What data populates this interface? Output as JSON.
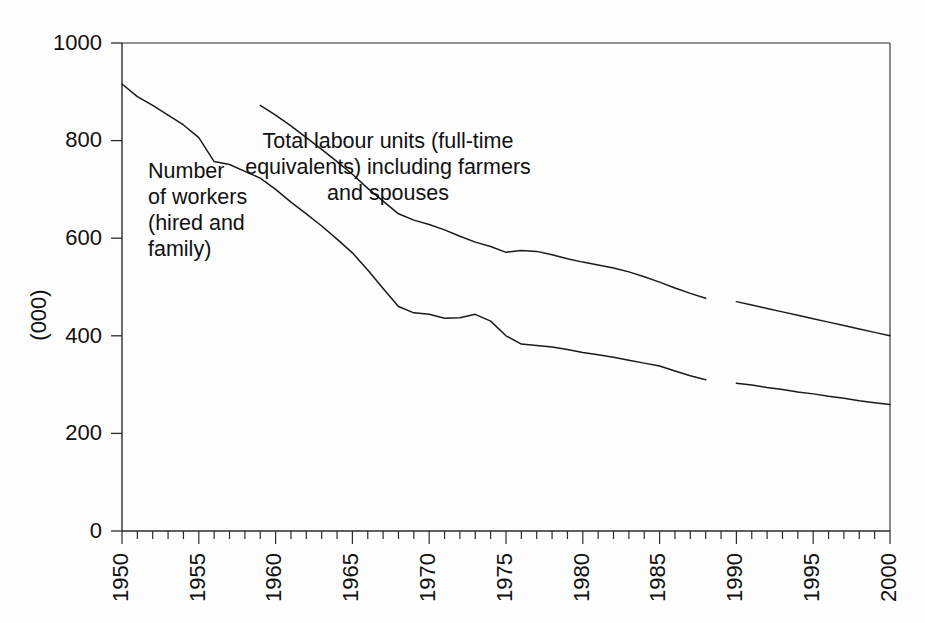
{
  "chart_data": {
    "type": "line",
    "title": "",
    "xlabel": "",
    "ylabel": "(000)",
    "xlim": [
      1950,
      2000
    ],
    "ylim": [
      0,
      1000
    ],
    "x_ticks_major": [
      "1950",
      "1955",
      "1960",
      "1965",
      "1970",
      "1975",
      "1980",
      "1985",
      "1990",
      "1995",
      "2000"
    ],
    "x_tick_interval_minor": 1,
    "y_ticks": [
      "0",
      "200",
      "400",
      "600",
      "800",
      "1000"
    ],
    "grid": false,
    "legend_position": "inline-annotations",
    "annotations": [
      {
        "name": "workers-annotation",
        "text_lines": [
          "Number",
          "of workers",
          "(hired and",
          "family)"
        ],
        "x_px": 148,
        "y_px": 178
      },
      {
        "name": "labour-units-annotation",
        "text_lines": [
          "Total labour units (full-time",
          "equivalents) including farmers",
          "and spouses"
        ],
        "x_px": 388,
        "y_px": 148
      }
    ],
    "series": [
      {
        "name": "Total labour units (full-time equivalents) including farmers and spouses",
        "color": "#1a1a1a",
        "x": [
          1959,
          1960,
          1961,
          1962,
          1963,
          1964,
          1965,
          1966,
          1967,
          1968,
          1969,
          1970,
          1971,
          1972,
          1973,
          1974,
          1975,
          1976,
          1977,
          1978,
          1979,
          1980,
          1981,
          1982,
          1983,
          1984,
          1985,
          1986,
          1987,
          1988
        ],
        "y": [
          872,
          852,
          830,
          806,
          782,
          757,
          731,
          702,
          676,
          650,
          637,
          628,
          617,
          604,
          592,
          583,
          571,
          575,
          573,
          566,
          558,
          551,
          545,
          539,
          531,
          521,
          510,
          498,
          487,
          477
        ],
        "x_projected": [
          1990,
          1991,
          1992,
          1993,
          1994,
          1995,
          1996,
          1997,
          1998,
          1999,
          2000
        ],
        "y_projected": [
          470,
          463,
          456,
          449,
          442,
          435,
          428,
          421,
          414,
          407,
          400
        ],
        "break_note": "gap between 1988 and 1990"
      },
      {
        "name": "Number of workers (hired and family)",
        "color": "#1a1a1a",
        "x": [
          1950,
          1951,
          1952,
          1953,
          1954,
          1955,
          1956,
          1957,
          1958,
          1959,
          1960,
          1961,
          1962,
          1963,
          1964,
          1965,
          1966,
          1967,
          1968,
          1969,
          1970,
          1971,
          1972,
          1973,
          1974,
          1975,
          1976,
          1977,
          1978,
          1979,
          1980,
          1981,
          1982,
          1983,
          1984,
          1985,
          1986,
          1987,
          1988
        ],
        "y": [
          916,
          890,
          872,
          852,
          832,
          806,
          757,
          751,
          737,
          723,
          700,
          674,
          650,
          625,
          598,
          570,
          535,
          497,
          460,
          447,
          444,
          436,
          437,
          444,
          430,
          400,
          383,
          380,
          377,
          372,
          366,
          361,
          356,
          350,
          344,
          338,
          328,
          318,
          310
        ],
        "x_projected": [
          1990,
          1991,
          1992,
          1993,
          1994,
          1995,
          1996,
          1997,
          1998,
          1999,
          2000
        ],
        "y_projected": [
          303,
          299,
          294,
          290,
          285,
          281,
          276,
          272,
          267,
          263,
          259
        ],
        "break_note": "gap between 1988 and 1990"
      }
    ]
  },
  "axes": {
    "plot_left_px": 122,
    "plot_right_px": 890,
    "plot_top_px": 43,
    "plot_bottom_px": 531
  }
}
